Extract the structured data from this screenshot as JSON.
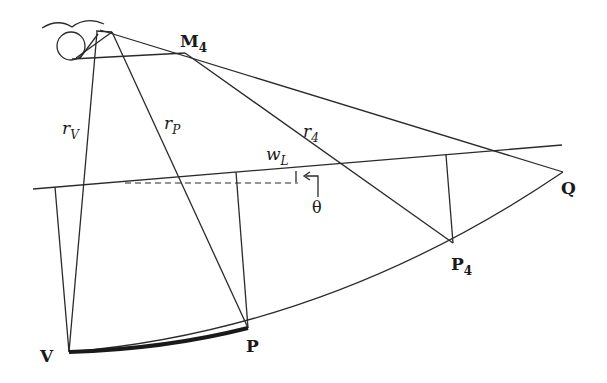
{
  "diagram": {
    "type": "geometric-projection",
    "labels": {
      "M4": {
        "main": "M",
        "sub": "4"
      },
      "rV": {
        "main": "r",
        "sub": "V"
      },
      "rP": {
        "main": "r",
        "sub": "P"
      },
      "r4": {
        "main": "r",
        "sub": "4"
      },
      "wL": {
        "main": "w",
        "sub": "L"
      },
      "theta": "θ",
      "Q": "Q",
      "P4": {
        "main": "P",
        "sub": "4"
      },
      "V": "V",
      "P": "P"
    },
    "points": {
      "eye": [
        112,
        32
      ],
      "M4": [
        185,
        53
      ],
      "V": [
        69,
        352
      ],
      "P": [
        248,
        328
      ],
      "P4": [
        453,
        243
      ],
      "Q": [
        563,
        172
      ]
    },
    "colors": {
      "stroke": "#2a2a2a",
      "background": "#ffffff"
    }
  }
}
